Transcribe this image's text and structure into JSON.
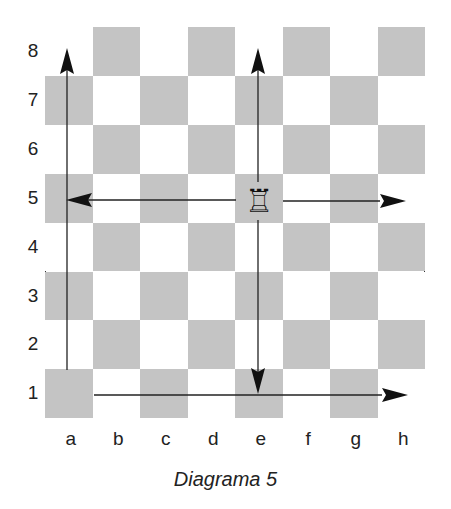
{
  "diagram": {
    "caption": "Diagrama 5",
    "ranks": [
      "8",
      "7",
      "6",
      "5",
      "4",
      "3",
      "2",
      "1"
    ],
    "files": [
      "a",
      "b",
      "c",
      "d",
      "e",
      "f",
      "g",
      "h"
    ],
    "colors": {
      "dark_square": "#c4c4c4",
      "light_square": "#ffffff",
      "border": "#333333"
    },
    "piece": {
      "type": "rook",
      "color": "white",
      "square": "e5",
      "glyph": "♖"
    },
    "arrows": [
      {
        "from": "e5",
        "to": "e8",
        "direction": "up"
      },
      {
        "from": "e5",
        "to": "e1",
        "direction": "down"
      },
      {
        "from": "e5",
        "to": "a5",
        "direction": "left"
      },
      {
        "from": "e5",
        "to": "h5",
        "direction": "right"
      },
      {
        "from": "a1",
        "to": "a8",
        "direction": "up"
      },
      {
        "from": "b1",
        "to": "h1",
        "direction": "right"
      }
    ]
  }
}
